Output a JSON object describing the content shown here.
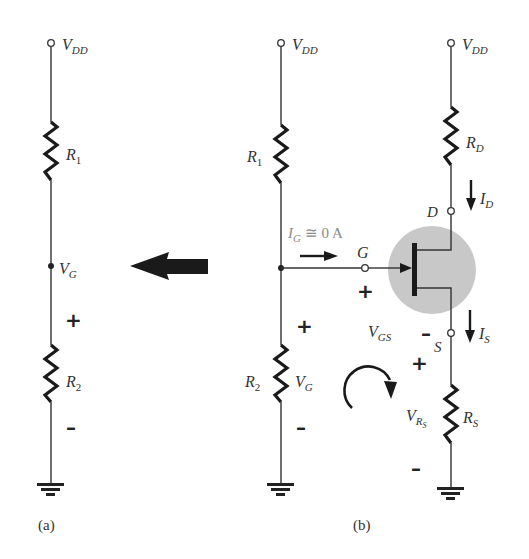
{
  "figure": {
    "panels": [
      {
        "id": "a",
        "caption": "(a)",
        "labels": {
          "vdd": "V",
          "vdd_sub": "DD",
          "r1": "R",
          "r1_sub": "1",
          "vg": "V",
          "vg_sub": "G",
          "r2": "R",
          "r2_sub": "2",
          "plus": "+",
          "minus": "–"
        }
      },
      {
        "id": "b",
        "caption": "(b)",
        "labels": {
          "vdd_left": "V",
          "vdd_left_sub": "DD",
          "vdd_right": "V",
          "vdd_right_sub": "DD",
          "r1": "R",
          "r1_sub": "1",
          "r2": "R",
          "r2_sub": "2",
          "vg": "V",
          "vg_sub": "G",
          "ig": "I",
          "ig_sub": "G",
          "ig_value": " ≅ 0 A",
          "gate": "G",
          "drain": "D",
          "source": "S",
          "rd": "R",
          "rd_sub": "D",
          "id": "I",
          "id_sub": "D",
          "is": "I",
          "is_sub": "S",
          "vgs": "V",
          "vgs_sub": "GS",
          "rs": "R",
          "rs_sub": "S",
          "vrs": "V",
          "vrs_sub": "R",
          "vrs_subsub": "S",
          "plus": "+",
          "minus": "–"
        }
      }
    ],
    "arrow_direction": "left",
    "colors": {
      "wire": "#333333",
      "resistor": "#1a1a1a",
      "jfet_highlight": "#c8c8c8",
      "ig_label": "#8a8a8a"
    }
  }
}
